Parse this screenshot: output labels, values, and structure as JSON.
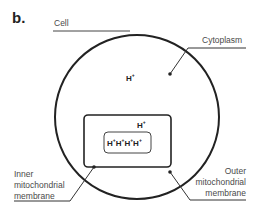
{
  "panel_label": "b.",
  "labels": {
    "cell": "Cell",
    "cytoplasm": "Cytoplasm",
    "inner_line1": "Inner",
    "inner_line2": "mitochondrial",
    "inner_line3": "membrane",
    "outer_line1": "Outer",
    "outer_line2": "mitochondrial",
    "outer_line3": "membrane"
  },
  "ions": {
    "cytoplasm_ion": "H",
    "intermembrane_ion": "H",
    "matrix_ions": [
      "H",
      "H",
      "H",
      "H"
    ],
    "charge": "+"
  },
  "colors": {
    "stroke": "#222222",
    "text": "#4a4a4a"
  }
}
